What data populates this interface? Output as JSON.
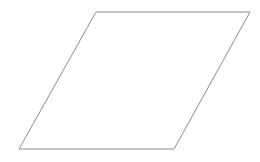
{
  "diagram": {
    "shape": "parallelogram",
    "stroke_color": "#8a8a8a",
    "fill_color": "#ffffff",
    "stroke_width": 1,
    "vertices": [
      [
        96,
        12
      ],
      [
        250,
        12
      ],
      [
        174,
        149
      ],
      [
        19,
        149
      ]
    ]
  }
}
